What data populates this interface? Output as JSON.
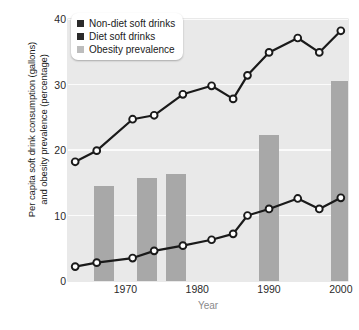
{
  "chart_data": {
    "type": "line",
    "title": "",
    "xlabel": "Year",
    "ylabel": "Per capita soft drink consumption (gallons)\nand obesity prevalence (percentage)",
    "xlim": [
      1962,
      2001
    ],
    "ylim": [
      0,
      40
    ],
    "yticks": [
      0,
      10,
      20,
      30,
      40
    ],
    "xticks": [
      1970,
      1980,
      1990,
      2000
    ],
    "grid": "horizontal-white",
    "legend_position": "top-left",
    "series": [
      {
        "name": "Non-diet soft drinks",
        "type": "line",
        "color": "#1a1a1a",
        "marker": "circle-open",
        "x": [
          1963,
          1966,
          1971,
          1974,
          1978,
          1982,
          1985,
          1987,
          1990,
          1994,
          1997,
          2000
        ],
        "values": [
          18.2,
          19.9,
          24.7,
          25.3,
          28.5,
          29.8,
          27.8,
          31.4,
          34.9,
          37.1,
          34.9,
          38.2
        ]
      },
      {
        "name": "Diet soft drinks",
        "type": "line",
        "color": "#1a1a1a",
        "marker": "circle-open",
        "x": [
          1963,
          1966,
          1971,
          1974,
          1978,
          1982,
          1985,
          1987,
          1990,
          1994,
          1997,
          2000
        ],
        "values": [
          2.2,
          2.8,
          3.5,
          4.6,
          5.4,
          6.3,
          7.2,
          10.0,
          11.0,
          12.6,
          11.0,
          12.7
        ]
      },
      {
        "name": "Obesity prevalence",
        "type": "bar",
        "color": "#a8a8a8",
        "x": [
          1967,
          1973,
          1977,
          1990,
          2000
        ],
        "values": [
          14.5,
          15.8,
          16.3,
          22.3,
          30.6
        ]
      }
    ]
  },
  "legend": {
    "items": [
      {
        "label": "Non-diet soft drinks",
        "color": "#2b2b2b"
      },
      {
        "label": "Diet soft drinks",
        "color": "#2b2b2b"
      },
      {
        "label": "Obesity prevalence",
        "color": "#bdbdbd"
      }
    ]
  },
  "axes": {
    "y_title": "Per capita soft drink consumption (gallons)\nand obesity prevalence (percentage)",
    "x_title": "Year",
    "y_tick_labels": [
      "40",
      "30",
      "20",
      "10",
      "0"
    ],
    "x_tick_labels": [
      "1970",
      "1980",
      "1990",
      "2000"
    ]
  },
  "colors": {
    "plot_background": "#e9e9e9",
    "gridline": "#fbfbfb",
    "bar": "#a8a8a8",
    "line": "#1a1a1a",
    "marker_fill": "#ffffff"
  }
}
